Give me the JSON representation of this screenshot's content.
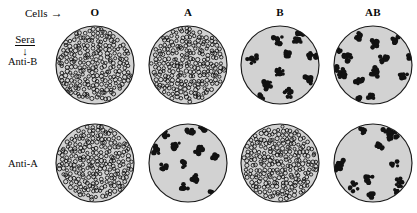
{
  "figure": {
    "title_cells": "Cells",
    "cells_arrow": "→",
    "sera_label": "Sera",
    "sera_arrow": "↓"
  },
  "column_headers": [
    {
      "label": "O",
      "x": 95
    },
    {
      "label": "A",
      "x": 188
    },
    {
      "label": "B",
      "x": 280
    },
    {
      "label": "AB",
      "x": 373
    }
  ],
  "row_labels": [
    {
      "label": "Anti-B",
      "x": 8,
      "y": 56
    },
    {
      "label": "Anti-A",
      "x": 8,
      "y": 158
    }
  ],
  "colors": {
    "well_fill": "#d2d2d2",
    "well_stroke": "#1a1a1a",
    "cell_ring": "#111111",
    "clump": "#121212",
    "background": "#ffffff",
    "text": "#0a0a0a"
  },
  "wells": [
    {
      "name": "well-anti-b-o",
      "serum": "Anti-B",
      "cells": "O",
      "result": "dispersed",
      "agglutination": false,
      "x": 55,
      "y": 25
    },
    {
      "name": "well-anti-b-a",
      "serum": "Anti-B",
      "cells": "A",
      "result": "dispersed",
      "agglutination": false,
      "x": 148,
      "y": 25
    },
    {
      "name": "well-anti-b-b",
      "serum": "Anti-B",
      "cells": "B",
      "result": "agglutinated",
      "agglutination": true,
      "x": 240,
      "y": 25
    },
    {
      "name": "well-anti-b-ab",
      "serum": "Anti-B",
      "cells": "AB",
      "result": "agglutinated",
      "agglutination": true,
      "x": 333,
      "y": 25
    },
    {
      "name": "well-anti-a-o",
      "serum": "Anti-A",
      "cells": "O",
      "result": "dispersed",
      "agglutination": false,
      "x": 55,
      "y": 123
    },
    {
      "name": "well-anti-a-a",
      "serum": "Anti-A",
      "cells": "A",
      "result": "agglutinated",
      "agglutination": true,
      "x": 148,
      "y": 123
    },
    {
      "name": "well-anti-a-b",
      "serum": "Anti-A",
      "cells": "B",
      "result": "dispersed",
      "agglutination": false,
      "x": 240,
      "y": 123
    },
    {
      "name": "well-anti-a-ab",
      "serum": "Anti-A",
      "cells": "AB",
      "result": "agglutinated",
      "agglutination": true,
      "x": 333,
      "y": 123
    }
  ]
}
